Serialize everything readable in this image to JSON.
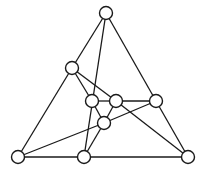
{
  "diagram": {
    "type": "graph",
    "nodes": [
      {
        "id": "top"
      },
      {
        "id": "left-upper"
      },
      {
        "id": "inner-left"
      },
      {
        "id": "inner-right"
      },
      {
        "id": "right"
      },
      {
        "id": "center-lower"
      },
      {
        "id": "bottom-left"
      },
      {
        "id": "bottom-mid"
      },
      {
        "id": "bottom-right"
      }
    ],
    "edges": [
      [
        "top",
        "left-upper"
      ],
      [
        "top",
        "right"
      ],
      [
        "top",
        "bottom-mid"
      ],
      [
        "left-upper",
        "bottom-left"
      ],
      [
        "left-upper",
        "inner-left"
      ],
      [
        "left-upper",
        "inner-right"
      ],
      [
        "inner-left",
        "inner-right"
      ],
      [
        "inner-right",
        "right"
      ],
      [
        "inner-left",
        "center-lower"
      ],
      [
        "inner-right",
        "center-lower"
      ],
      [
        "inner-right",
        "bottom-right"
      ],
      [
        "center-lower",
        "right"
      ],
      [
        "center-lower",
        "bottom-mid"
      ],
      [
        "bottom-left",
        "center-lower"
      ],
      [
        "bottom-left",
        "bottom-mid"
      ],
      [
        "bottom-mid",
        "bottom-right"
      ],
      [
        "right",
        "bottom-right"
      ]
    ]
  }
}
